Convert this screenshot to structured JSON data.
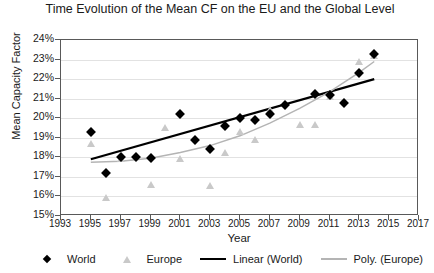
{
  "chart_data": {
    "type": "scatter",
    "title": "Time Evolution of the Mean CF on the EU and the Global Level",
    "xlabel": "Year",
    "ylabel": "Mean Capacity Factor",
    "xlim": [
      1993,
      2017
    ],
    "ylim": [
      15,
      24
    ],
    "xticks": [
      1993,
      1995,
      1997,
      1999,
      2001,
      2003,
      2005,
      2007,
      2009,
      2011,
      2013,
      2015,
      2017
    ],
    "xticklabels": [
      "1993",
      "1995",
      "1997",
      "1999",
      "2001",
      "2003",
      "2005",
      "2007",
      "2009",
      "2011",
      "2013",
      "2015",
      "2017"
    ],
    "yticks": [
      15,
      16,
      17,
      18,
      19,
      20,
      21,
      22,
      23,
      24
    ],
    "yticklabels": [
      "15%",
      "16%",
      "17%",
      "18%",
      "19%",
      "20%",
      "21%",
      "22%",
      "23%",
      "24%"
    ],
    "grid": true,
    "legend_position": "bottom",
    "series": [
      {
        "name": "World",
        "marker": "diamond",
        "color": "#000000",
        "points": [
          {
            "x": 1995,
            "y": 19.3
          },
          {
            "x": 1996,
            "y": 17.2
          },
          {
            "x": 1997,
            "y": 18.0
          },
          {
            "x": 1998,
            "y": 18.0
          },
          {
            "x": 1999,
            "y": 17.95
          },
          {
            "x": 2001,
            "y": 20.2
          },
          {
            "x": 2002,
            "y": 18.9
          },
          {
            "x": 2003,
            "y": 18.45
          },
          {
            "x": 2004,
            "y": 19.6
          },
          {
            "x": 2005,
            "y": 20.0
          },
          {
            "x": 2006,
            "y": 19.9
          },
          {
            "x": 2007,
            "y": 20.2
          },
          {
            "x": 2008,
            "y": 20.7
          },
          {
            "x": 2010,
            "y": 21.25
          },
          {
            "x": 2011,
            "y": 21.2
          },
          {
            "x": 2012,
            "y": 20.8
          },
          {
            "x": 2013,
            "y": 22.3
          },
          {
            "x": 2014,
            "y": 23.3
          }
        ]
      },
      {
        "name": "Europe",
        "marker": "triangle",
        "color": "#c9c9c9",
        "points": [
          {
            "x": 1995,
            "y": 18.7
          },
          {
            "x": 1996,
            "y": 15.9
          },
          {
            "x": 1997,
            "y": 17.9
          },
          {
            "x": 1999,
            "y": 16.6
          },
          {
            "x": 2000,
            "y": 19.5
          },
          {
            "x": 2001,
            "y": 17.9
          },
          {
            "x": 2003,
            "y": 16.55
          },
          {
            "x": 2004,
            "y": 18.2
          },
          {
            "x": 2005,
            "y": 19.3
          },
          {
            "x": 2006,
            "y": 18.9
          },
          {
            "x": 2007,
            "y": 20.4
          },
          {
            "x": 2009,
            "y": 19.65
          },
          {
            "x": 2010,
            "y": 19.65
          },
          {
            "x": 2011,
            "y": 21.1
          },
          {
            "x": 2013,
            "y": 22.9
          },
          {
            "x": 2014,
            "y": 23.2
          }
        ]
      }
    ],
    "trendlines": [
      {
        "name": "Linear (World)",
        "type": "linear",
        "color": "#000000",
        "x_start": 1995,
        "x_end": 2014,
        "y_start": 17.9,
        "y_end": 22.0
      },
      {
        "name": "Poly. (Europe)",
        "type": "polynomial",
        "color": "#b4b4b4",
        "x_start": 1995,
        "x_end": 2014,
        "points": [
          {
            "x": 1995,
            "y": 17.75
          },
          {
            "x": 1997,
            "y": 17.8
          },
          {
            "x": 1999,
            "y": 17.95
          },
          {
            "x": 2001,
            "y": 18.25
          },
          {
            "x": 2003,
            "y": 18.6
          },
          {
            "x": 2005,
            "y": 19.1
          },
          {
            "x": 2007,
            "y": 19.75
          },
          {
            "x": 2009,
            "y": 20.5
          },
          {
            "x": 2011,
            "y": 21.35
          },
          {
            "x": 2013,
            "y": 22.35
          },
          {
            "x": 2014,
            "y": 22.9
          }
        ]
      }
    ]
  },
  "legend": {
    "items": [
      {
        "label": "World",
        "key": "diamond-marker"
      },
      {
        "label": "Europe",
        "key": "triangle-marker"
      },
      {
        "label": "Linear (World)",
        "key": "black-line"
      },
      {
        "label": "Poly. (Europe)",
        "key": "gray-line"
      }
    ]
  }
}
